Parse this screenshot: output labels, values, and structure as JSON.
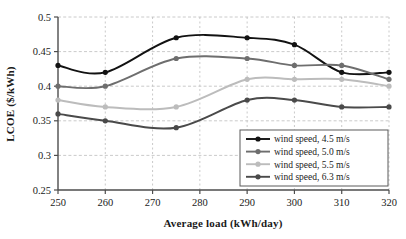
{
  "chart_data": {
    "type": "line",
    "title": "",
    "xlabel": "Average load (kWh/day)",
    "ylabel": "LCOE ($/kWh)",
    "x": [
      250,
      260,
      275,
      290,
      300,
      310,
      320
    ],
    "xlim": [
      250,
      320
    ],
    "ylim": [
      0.25,
      0.5
    ],
    "xticks": [
      250,
      260,
      270,
      280,
      290,
      300,
      310,
      320
    ],
    "yticks": [
      0.25,
      0.3,
      0.35,
      0.4,
      0.45,
      0.5
    ],
    "xtick_labels": [
      "250",
      "260",
      "270",
      "280",
      "290",
      "300",
      "310",
      "320"
    ],
    "ytick_labels": [
      "0.25",
      "0.3",
      "0.35",
      "0.4",
      "0.45",
      "0.5"
    ],
    "grid": true,
    "grid_style": "dotted",
    "grid_color": "#bdbdbd",
    "legend_position": "lower right",
    "series": [
      {
        "name": "wind speed, 4.5 m/s",
        "color": "#121212",
        "values": [
          0.43,
          0.42,
          0.47,
          0.47,
          0.46,
          0.42,
          0.42
        ]
      },
      {
        "name": "wind speed, 5.0 m/s",
        "color": "#6e6e6e",
        "values": [
          0.4,
          0.4,
          0.44,
          0.44,
          0.43,
          0.43,
          0.41
        ]
      },
      {
        "name": "wind speed, 5.5 m/s",
        "color": "#bcbcbc",
        "values": [
          0.38,
          0.37,
          0.37,
          0.41,
          0.41,
          0.41,
          0.4
        ]
      },
      {
        "name": "wind speed, 6.3 m/s",
        "color": "#4a4a4a",
        "values": [
          0.36,
          0.35,
          0.34,
          0.38,
          0.38,
          0.37,
          0.37
        ]
      }
    ]
  },
  "legend": {
    "items": [
      {
        "label": "wind speed, 4.5 m/s",
        "color": "#121212"
      },
      {
        "label": "wind speed, 5.0 m/s",
        "color": "#6e6e6e"
      },
      {
        "label": "wind speed, 5.5 m/s",
        "color": "#bcbcbc"
      },
      {
        "label": "wind speed, 6.3 m/s",
        "color": "#4a4a4a"
      }
    ]
  }
}
